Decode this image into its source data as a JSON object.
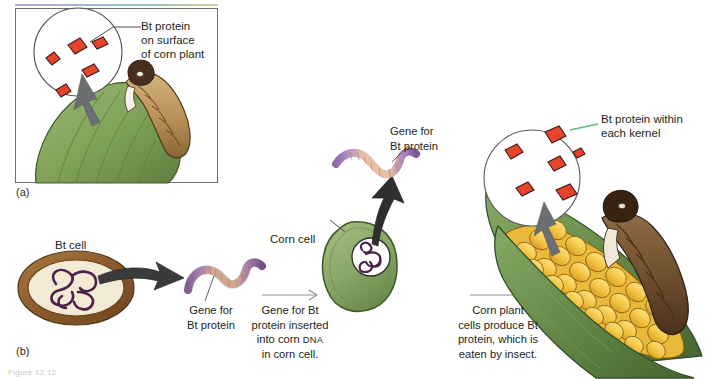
{
  "figure": {
    "background_color": "#ffffff",
    "panels": [
      {
        "id": "a",
        "letter": "(a)"
      },
      {
        "id": "b",
        "letter": "(b)"
      }
    ]
  },
  "panel_a": {
    "letter": "(a)",
    "callout": {
      "name": "bt-protein-surface-callout",
      "line1": "Bt protein",
      "line2": "on surface",
      "line3": "of corn plant"
    },
    "magnifier": {
      "name": "magnifier-circle-leaf",
      "protein_marker_color": "#e8442c",
      "protein_marker_count": 5
    },
    "leaf": {
      "name": "corn-leaf",
      "color": "#7fa05a"
    },
    "caterpillar": {
      "name": "caterpillar-on-leaf",
      "body_color": "#c2a06a",
      "head_color": "#4a2f20"
    },
    "pointer_arrow": {
      "name": "magnifier-pointer-arrow",
      "color": "#6c6f72"
    }
  },
  "panel_b": {
    "letter": "(b)",
    "step1": {
      "bt_cell_label": "Bt cell",
      "cell_name": "bt-cell",
      "wall_color": "#8a5a2b",
      "cytoplasm_color": "#f3ead6",
      "dna_color": "#4b2147"
    },
    "step1_arrow": {
      "name": "bt-cell-to-gene-arrow",
      "color": "#3a3a3a"
    },
    "gene_left": {
      "name": "gene-for-bt-protein-left",
      "label_line1": "Gene for",
      "label_line2": "Bt protein",
      "end_color": "#8f6aa8",
      "middle_color": "#e8c0a6"
    },
    "caption1": {
      "name": "caption-gene-inserted",
      "line1": "Gene for Bt",
      "line2": "protein inserted",
      "line3_pre": "into corn ",
      "line3_smallcaps": "DNA",
      "line4": "in corn cell."
    },
    "arrow1": {
      "name": "caption1-arrow",
      "color": "#8d8d8d"
    },
    "corn_cell": {
      "name": "corn-cell",
      "label": "Corn cell",
      "body_color": "#8aa96a",
      "nucleus_color": "#ffffff",
      "dna_color": "#4b2147"
    },
    "gene_top": {
      "name": "gene-for-bt-protein-top",
      "label_line1": "Gene for",
      "label_line2": "Bt protein"
    },
    "insert_arrow": {
      "name": "gene-insertion-arrow",
      "color": "#2f2f2f"
    },
    "caption2": {
      "name": "caption-cells-produce-bt",
      "line1": "Corn plant",
      "line2": "cells produce Bt",
      "line3": "protein, which is",
      "line4": "eaten by insect."
    },
    "arrow2": {
      "name": "caption2-arrow",
      "color": "#8d8d8d"
    },
    "corn_ear": {
      "name": "corn-ear-with-kernels",
      "kernel_color": "#f2c84b",
      "husk_color": "#5f7f45",
      "caterpillar_color": "#6b4a2a"
    },
    "kernel_callout": {
      "name": "bt-protein-kernel-callout",
      "line1": "Bt protein within",
      "line2": "each kernel",
      "leader_color": "#5cbd7a"
    },
    "kernel_magnifier": {
      "name": "magnifier-circle-kernels",
      "protein_marker_color": "#e8442c",
      "protein_marker_count": 6
    },
    "kernel_pointer_arrow": {
      "name": "kernel-magnifier-pointer-arrow",
      "color": "#6c6f72"
    }
  },
  "footer": {
    "stub": "Figure 12.12"
  }
}
